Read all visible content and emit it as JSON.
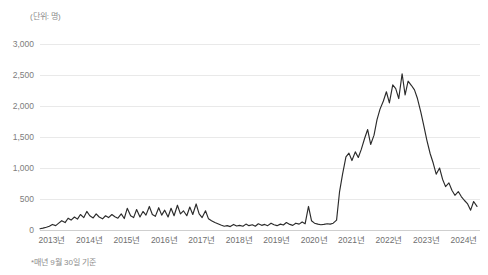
{
  "unit_label": "(단위: 명)",
  "footnote": "*매년 9월 30일 기준",
  "colors": {
    "series": "#2b2b2b",
    "grid": "#e9e9e9",
    "axis": "#cfcfcf",
    "tick_text": "#7d7d7d",
    "muted_text": "#8c8c8c",
    "background": "#ffffff"
  },
  "chart_data": {
    "type": "line",
    "title": "",
    "subtitle": "",
    "xlabel": "",
    "ylabel": "(단위: 명)",
    "unit": "명",
    "note": "*매년 9월 30일 기준",
    "grid": true,
    "legend": false,
    "legend_position": "none",
    "ylim": [
      0,
      3000
    ],
    "yticks": [
      0,
      500,
      1000,
      1500,
      2000,
      2500,
      3000
    ],
    "ytick_labels": [
      "0",
      "500",
      "1,000",
      "1,500",
      "2,000",
      "2,500",
      "3,000"
    ],
    "xlim": [
      2013.0,
      2024.75
    ],
    "xticks": [
      2013,
      2014,
      2015,
      2016,
      2017,
      2018,
      2019,
      2020,
      2021,
      2022,
      2023,
      2024
    ],
    "xtick_labels": [
      "2013년",
      "2014년",
      "2015년",
      "2016년",
      "2017년",
      "2018년",
      "2019년",
      "2020년",
      "2021년",
      "2022년",
      "2023년",
      "2024년"
    ],
    "series": [
      {
        "name": "인원",
        "x": [
          2013.0,
          2013.08,
          2013.17,
          2013.25,
          2013.33,
          2013.42,
          2013.5,
          2013.58,
          2013.67,
          2013.75,
          2013.83,
          2013.92,
          2014.0,
          2014.08,
          2014.17,
          2014.25,
          2014.33,
          2014.42,
          2014.5,
          2014.58,
          2014.67,
          2014.75,
          2014.83,
          2014.92,
          2015.0,
          2015.08,
          2015.17,
          2015.25,
          2015.33,
          2015.42,
          2015.5,
          2015.58,
          2015.67,
          2015.75,
          2015.83,
          2015.92,
          2016.0,
          2016.08,
          2016.17,
          2016.25,
          2016.33,
          2016.42,
          2016.5,
          2016.58,
          2016.67,
          2016.75,
          2016.83,
          2016.92,
          2017.0,
          2017.08,
          2017.17,
          2017.25,
          2017.33,
          2017.42,
          2017.5,
          2017.58,
          2017.67,
          2017.75,
          2017.83,
          2017.92,
          2018.0,
          2018.08,
          2018.17,
          2018.25,
          2018.33,
          2018.42,
          2018.5,
          2018.58,
          2018.67,
          2018.75,
          2018.83,
          2018.92,
          2019.0,
          2019.08,
          2019.17,
          2019.25,
          2019.33,
          2019.42,
          2019.5,
          2019.58,
          2019.67,
          2019.75,
          2019.83,
          2019.92,
          2020.0,
          2020.08,
          2020.17,
          2020.25,
          2020.33,
          2020.42,
          2020.5,
          2020.58,
          2020.67,
          2020.75,
          2020.83,
          2020.92,
          2021.0,
          2021.08,
          2021.17,
          2021.25,
          2021.33,
          2021.42,
          2021.5,
          2021.58,
          2021.67,
          2021.75,
          2021.83,
          2021.92,
          2022.0,
          2022.08,
          2022.17,
          2022.25,
          2022.33,
          2022.42,
          2022.5,
          2022.58,
          2022.67,
          2022.75,
          2022.83,
          2022.92,
          2023.0,
          2023.08,
          2023.17,
          2023.25,
          2023.33,
          2023.42,
          2023.5,
          2023.58,
          2023.67,
          2023.75,
          2023.83,
          2023.92,
          2024.0,
          2024.08,
          2024.17,
          2024.25,
          2024.33,
          2024.42,
          2024.5,
          2024.58,
          2024.67
        ],
        "values": [
          20,
          30,
          45,
          60,
          90,
          70,
          110,
          150,
          120,
          190,
          160,
          210,
          175,
          250,
          200,
          300,
          230,
          195,
          260,
          210,
          180,
          230,
          200,
          250,
          215,
          190,
          260,
          185,
          350,
          230,
          200,
          330,
          210,
          300,
          240,
          380,
          250,
          220,
          360,
          240,
          320,
          210,
          350,
          230,
          400,
          260,
          310,
          230,
          370,
          250,
          420,
          260,
          200,
          310,
          180,
          150,
          120,
          100,
          80,
          60,
          70,
          55,
          90,
          65,
          75,
          60,
          95,
          70,
          85,
          60,
          100,
          75,
          90,
          70,
          110,
          85,
          70,
          95,
          80,
          120,
          90,
          75,
          110,
          95,
          130,
          100,
          380,
          150,
          110,
          95,
          85,
          90,
          100,
          95,
          110,
          160,
          620,
          900,
          1180,
          1240,
          1120,
          1260,
          1170,
          1300,
          1480,
          1620,
          1380,
          1530,
          1780,
          1950,
          2080,
          2230,
          2050,
          2340,
          2280,
          2120,
          2520,
          2180,
          2400,
          2330,
          2260,
          2120,
          1900,
          1680,
          1450,
          1230,
          1080,
          900,
          1000,
          820,
          700,
          760,
          640,
          560,
          620,
          540,
          480,
          420,
          320,
          460,
          380
        ]
      }
    ]
  }
}
